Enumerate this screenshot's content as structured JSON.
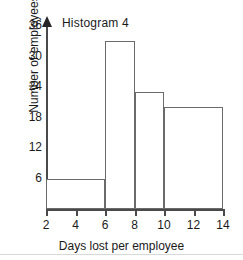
{
  "chart_data": {
    "type": "bar",
    "title": "Histogram 4",
    "xlabel": "Days lost per employee",
    "ylabel": "Number of employees",
    "xlim": [
      2,
      14
    ],
    "ylim": [
      0,
      36
    ],
    "grid": false,
    "legend": null,
    "xticks": [
      2,
      4,
      6,
      8,
      10,
      12,
      14
    ],
    "yticks": [
      6,
      12,
      18,
      24,
      30,
      36
    ],
    "xtick_labels": [
      "2",
      "4",
      "6",
      "8",
      "10",
      "12",
      "14"
    ],
    "ytick_labels": [
      "6",
      "12",
      "18",
      "24",
      "30",
      "36"
    ],
    "bin_edges": [
      2,
      6,
      8,
      10,
      14
    ],
    "categories": [
      "2-6",
      "6-8",
      "8-10",
      "10-14"
    ],
    "values": [
      6,
      33,
      23,
      20
    ],
    "bars": [
      {
        "label": "2-6",
        "x_start": 2,
        "x_end": 6,
        "value": 6
      },
      {
        "label": "6-8",
        "x_start": 6,
        "x_end": 8,
        "value": 33
      },
      {
        "label": "8-10",
        "x_start": 8,
        "x_end": 10,
        "value": 23
      },
      {
        "label": "10-14",
        "x_start": 10,
        "x_end": 14,
        "value": 20
      }
    ],
    "bar_fill_color": "#ffffff",
    "bar_edge_color": "#6b6b6b",
    "axis_color": "#4a4a4a",
    "text_color": "#1a1a1a"
  }
}
